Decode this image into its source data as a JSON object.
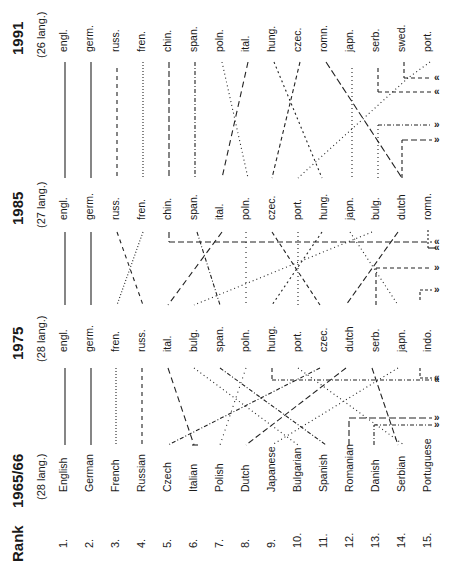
{
  "figure": {
    "rank_header": "Rank",
    "ranks": [
      "1.",
      "2.",
      "3.",
      "4.",
      "5.",
      "6.",
      "7.",
      "8.",
      "9.",
      "10.",
      "11.",
      "12.",
      "13.",
      "14.",
      "15."
    ],
    "periods": [
      {
        "year": "1991",
        "count": "(26  lang.)",
        "languages": [
          "engl.",
          "germ.",
          "russ.",
          "fren.",
          "chin.",
          "span.",
          "poln.",
          "ital.",
          "hung.",
          "czec.",
          "romn.",
          "japn.",
          "serb.",
          "swed.",
          "port."
        ]
      },
      {
        "year": "1985",
        "count": "(27  lang.)",
        "languages": [
          "engl.",
          "germ.",
          "russ.",
          "fren.",
          "chin.",
          "span.",
          "ital.",
          "poln.",
          "czec.",
          "port.",
          "hung.",
          "japn.",
          "bulg.",
          "dutch",
          "romn."
        ]
      },
      {
        "year": "1975",
        "count": "(28  lang.)",
        "languages": [
          "engl.",
          "germ.",
          "fren.",
          "russ.",
          "ital.",
          "bulg.",
          "span.",
          "poln.",
          "hung.",
          "port.",
          "czec.",
          "dutch",
          "serb.",
          "japn.",
          "indo."
        ]
      },
      {
        "year": "1965/66",
        "count": "(28  lang.)",
        "languages": [
          "English",
          "German",
          "French",
          "Russian",
          "Czech",
          "Italian",
          "Polish",
          "Dutch",
          "Japanese",
          "Bulgarian",
          "Spanish",
          "Romanian",
          "Danish",
          "Serbian",
          "Portuguese"
        ]
      }
    ],
    "arrow_markers": {
      "exit": "«",
      "enter": "»"
    }
  }
}
